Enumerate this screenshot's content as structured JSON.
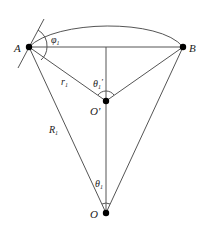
{
  "diagram": {
    "points": {
      "A": {
        "label": "A",
        "x": 29,
        "y": 47
      },
      "B": {
        "label": "B",
        "x": 183,
        "y": 47
      },
      "O_prime": {
        "label": "O'",
        "x": 106,
        "y": 101
      },
      "O": {
        "label": "O",
        "x": 106,
        "y": 213
      }
    },
    "labels": {
      "phi1": "φ",
      "phi1_sub": "1",
      "r1": "r",
      "r1_sub": "1",
      "R1": "R",
      "R1_sub": "1",
      "theta1_prime": "θ",
      "theta1_prime_sub": "1",
      "theta1_prime_mark": "'",
      "theta1": "θ",
      "theta1_sub": "1"
    },
    "colors": {
      "line": "#555555",
      "point": "#000000",
      "text": "#222222"
    }
  }
}
